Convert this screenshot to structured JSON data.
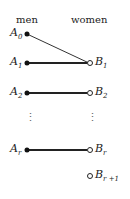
{
  "headers": {
    "left": "men",
    "right": "women"
  },
  "nodes": {
    "A0": {
      "base": "A",
      "sub": "0"
    },
    "A1": {
      "base": "A",
      "sub": "1"
    },
    "A2": {
      "base": "A",
      "sub": "2"
    },
    "Ar": {
      "base": "A",
      "sub": "r"
    },
    "B1": {
      "base": "B",
      "sub": "1"
    },
    "B2": {
      "base": "B",
      "sub": "2"
    },
    "Br": {
      "base": "B",
      "sub": "r"
    },
    "Br1": {
      "base": "B",
      "sub": "r +1"
    }
  },
  "ellipsis": "⋮"
}
